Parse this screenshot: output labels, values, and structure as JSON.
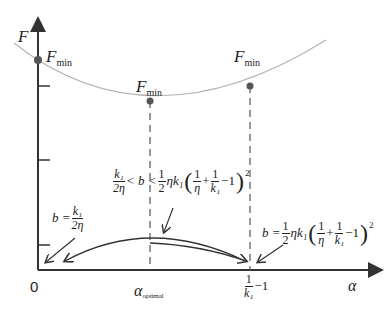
{
  "diagram": {
    "y_axis_label": "F",
    "x_axis_label": "α",
    "origin_label": "0",
    "point_labels": {
      "left": {
        "main": "F",
        "sub": "min"
      },
      "middle": {
        "main": "F",
        "sub": "min"
      },
      "right": {
        "main": "F",
        "sub": "min"
      }
    },
    "x_ticks": {
      "optimal": {
        "main": "α",
        "sub": "optimal"
      },
      "limit": {
        "num": "1",
        "den": "k₁",
        "suffix": "−1"
      }
    },
    "annotations": {
      "left_eq": {
        "lhs": "b =",
        "num": "k₁",
        "den": "2η"
      },
      "middle_ineq": {
        "f1_num": "k₁",
        "f1_den": "2η",
        "mid": "< b <",
        "f2_num": "1",
        "f2_den": "2",
        "ek": "ηk₁",
        "i1_num": "1",
        "i1_den": "η",
        "plus": "+",
        "i2_num": "1",
        "i2_den": "k₁",
        "minus": "−1",
        "exp": "2"
      },
      "right_eq": {
        "lhs": "b =",
        "f_num": "1",
        "f_den": "2",
        "ek": "ηk₁",
        "i1_num": "1",
        "i1_den": "η",
        "plus": "+",
        "i2_num": "1",
        "i2_den": "k₁",
        "minus": "−1",
        "exp": "2"
      }
    },
    "colors": {
      "axis": "#333333",
      "curve": "#b5b5b5",
      "point": "#555555"
    }
  }
}
